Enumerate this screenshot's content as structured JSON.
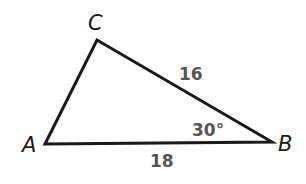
{
  "diagram": {
    "type": "triangle",
    "vertices": {
      "A": {
        "label": "A"
      },
      "B": {
        "label": "B"
      },
      "C": {
        "label": "C"
      }
    },
    "sides": {
      "BC": {
        "length": "16"
      },
      "AB": {
        "length": "18"
      }
    },
    "angles": {
      "B": {
        "measure": "30°"
      }
    },
    "colors": {
      "stroke": "#1a1a1a",
      "measurement_text": "#555555"
    }
  }
}
